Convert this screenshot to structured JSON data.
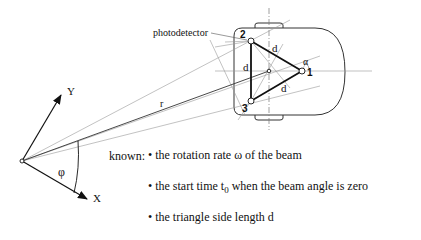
{
  "diagram": {
    "labels": {
      "photodetector": "photodetector",
      "node1": "1",
      "node2": "2",
      "node3": "3",
      "side_top": "d",
      "side_left": "d",
      "side_bottom": "d",
      "alpha": "α",
      "r": "r",
      "phi": "φ",
      "axis_x": "X",
      "axis_y": "Y"
    },
    "known": {
      "heading": "known:",
      "items": [
        {
          "text": "• the rotation rate ω of the beam"
        },
        {
          "prefix": "• the start time t",
          "subscript": "0",
          "suffix": " when the beam angle is zero"
        },
        {
          "text": "• the triangle side length d"
        }
      ]
    },
    "colors": {
      "line": "#111111",
      "thin_line": "#888888",
      "background": "#ffffff"
    }
  }
}
